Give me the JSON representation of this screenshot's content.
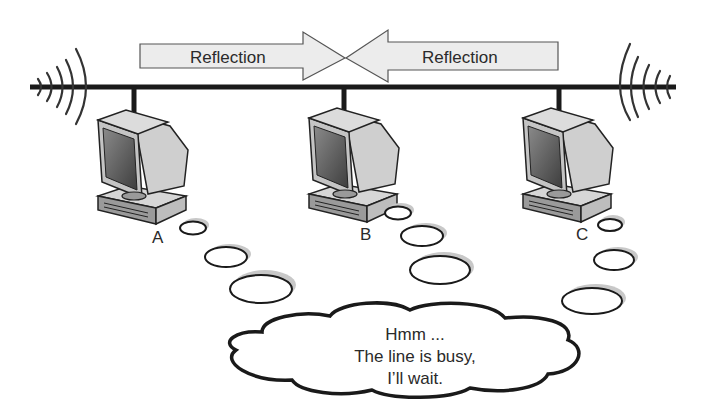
{
  "diagram": {
    "type": "network-bus-carrier-sense",
    "arrows": [
      {
        "label": "Reflection",
        "direction": "right"
      },
      {
        "label": "Reflection",
        "direction": "left"
      }
    ],
    "nodes": [
      {
        "label": "A"
      },
      {
        "label": "B"
      },
      {
        "label": "C"
      }
    ],
    "thought_bubble": {
      "lines": [
        "Hmm ...",
        "The line is busy,",
        "I’ll wait."
      ]
    },
    "colors": {
      "line": "#1a1a1a",
      "arrow_fill": "#ececec",
      "arrow_stroke": "#555555",
      "monitor_face": "#bdbdbd",
      "screen": "#6e6e6e",
      "bubble_shadow": "#c8c8c8"
    }
  }
}
